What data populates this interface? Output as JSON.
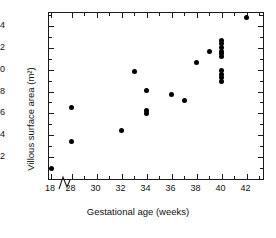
{
  "chart_data": {
    "type": "scatter",
    "title": "",
    "xlabel": "Gestational age (weeks)",
    "ylabel": "Villous surface area (m²)",
    "xlim": [
      18,
      43
    ],
    "ylim": [
      0,
      15
    ],
    "grid": false,
    "legend": null,
    "axis_break": {
      "after": 18,
      "resume": 27,
      "symbol": "zigzag"
    },
    "x_ticks_major": [
      18,
      28,
      30,
      32,
      34,
      36,
      38,
      40,
      42
    ],
    "x_ticks_minor": [
      29,
      31,
      33,
      35,
      37,
      39,
      41,
      43
    ],
    "y_ticks_major": [
      2,
      4,
      6,
      8,
      10,
      12,
      14
    ],
    "y_ticks_minor": [
      1,
      3,
      5,
      7,
      9,
      11,
      13,
      15
    ],
    "x_tick_labels": [
      "18",
      "28",
      "30",
      "32",
      "34",
      "36",
      "38",
      "40",
      "42"
    ],
    "y_tick_labels": [
      "2",
      "4",
      "6",
      "8",
      "10",
      "12",
      "14"
    ],
    "marker": "filled-circle",
    "marker_color": "#000000",
    "points": [
      {
        "x": 18,
        "y": 1.0
      },
      {
        "x": 28,
        "y": 6.55
      },
      {
        "x": 28,
        "y": 3.4
      },
      {
        "x": 32,
        "y": 4.4
      },
      {
        "x": 33,
        "y": 9.8
      },
      {
        "x": 34,
        "y": 8.1
      },
      {
        "x": 34,
        "y": 6.3
      },
      {
        "x": 34,
        "y": 6.0
      },
      {
        "x": 36,
        "y": 7.7
      },
      {
        "x": 37,
        "y": 7.2
      },
      {
        "x": 38,
        "y": 10.65
      },
      {
        "x": 39,
        "y": 11.7
      },
      {
        "x": 40,
        "y": 12.7
      },
      {
        "x": 40,
        "y": 12.4
      },
      {
        "x": 40,
        "y": 12.0
      },
      {
        "x": 40,
        "y": 11.7
      },
      {
        "x": 40,
        "y": 11.45
      },
      {
        "x": 40,
        "y": 11.2
      },
      {
        "x": 40,
        "y": 9.9
      },
      {
        "x": 40,
        "y": 9.6
      },
      {
        "x": 40,
        "y": 9.3
      },
      {
        "x": 40,
        "y": 8.9
      },
      {
        "x": 42,
        "y": 14.75
      }
    ]
  }
}
